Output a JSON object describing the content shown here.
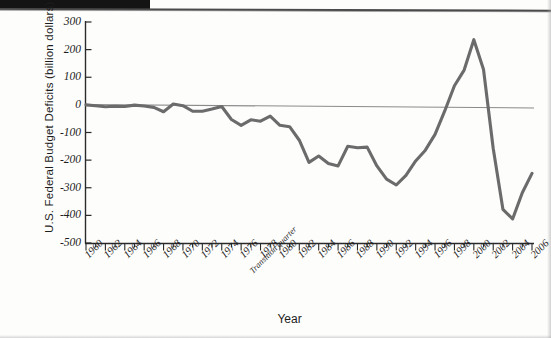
{
  "chart_data": {
    "type": "line",
    "title": "",
    "xlabel": "Year",
    "ylabel": "U.S. Federal Budget Deficits (billion dollars)",
    "ylim": [
      -500,
      300
    ],
    "xlim": [
      1960,
      2006
    ],
    "grid": false,
    "legend": null,
    "y_ticks": [
      300,
      200,
      100,
      0,
      -100,
      -200,
      -300,
      -400,
      -500
    ],
    "y_tick_labels": [
      "300",
      "200",
      "100",
      "0",
      "-100",
      "-200",
      "-300",
      "-400",
      "-500"
    ],
    "x_tick_labels": [
      "1960",
      "1962",
      "1964",
      "1966",
      "1968",
      "1970",
      "1972",
      "1974",
      "1976",
      "Transition quarter",
      "1978",
      "1980",
      "1982",
      "1984",
      "1986",
      "1988",
      "1990",
      "1992",
      "1994",
      "1996",
      "1998",
      "2000",
      "2002",
      "2004",
      "2006"
    ],
    "annotations": [
      "Transition quarter"
    ],
    "series": [
      {
        "name": "U.S. Federal Budget Surplus/Deficit",
        "color": "#6b6b6b",
        "x": [
          1960,
          1961,
          1962,
          1963,
          1964,
          1965,
          1966,
          1967,
          1968,
          1969,
          1970,
          1971,
          1972,
          1973,
          1974,
          1975,
          1976,
          1977,
          1978,
          1979,
          1980,
          1981,
          1982,
          1983,
          1984,
          1985,
          1986,
          1987,
          1988,
          1989,
          1990,
          1991,
          1992,
          1993,
          1994,
          1995,
          1996,
          1997,
          1998,
          1999,
          2000,
          2001,
          2002,
          2003,
          2004,
          2005,
          2006
        ],
        "values": [
          0,
          -3,
          -7,
          -5,
          -6,
          -1,
          -4,
          -9,
          -25,
          3,
          -3,
          -23,
          -23,
          -15,
          -6,
          -53,
          -74,
          -54,
          -59,
          -41,
          -74,
          -79,
          -128,
          -208,
          -185,
          -212,
          -221,
          -150,
          -155,
          -153,
          -221,
          -269,
          -290,
          -255,
          -203,
          -164,
          -107,
          -22,
          69,
          126,
          236,
          128,
          -158,
          -378,
          -413,
          -318,
          -248
        ]
      }
    ],
    "reference_lines": [
      {
        "name": "zero-line",
        "y": 0,
        "color": "#8a8a8a"
      }
    ]
  },
  "axes": {
    "y_title": "U.S. Federal Budget Deficits (billion dollars)",
    "x_title": "Year"
  }
}
